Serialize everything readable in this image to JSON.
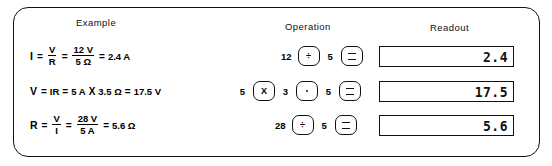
{
  "figure": {
    "headers": {
      "example": "Example",
      "operation": "Operation",
      "readout": "Readout"
    },
    "rows": [
      {
        "formula": {
          "result_symbol": "I",
          "eq1": "=",
          "frac1_num": "V",
          "frac1_den": "R",
          "eq2": "=",
          "frac2_num": "12 V",
          "frac2_den": "5 Ω",
          "eq3": "=",
          "result": "2.4 A"
        },
        "operation": {
          "operand1": "12",
          "key1": "÷",
          "operand2": "5",
          "key2": "=",
          "key1_name": "divide-key",
          "key2_name": "equals-key"
        },
        "readout": "2.4"
      },
      {
        "formula": {
          "result_symbol": "V",
          "eq1": "=",
          "expr": "IR",
          "eq2": "=",
          "operand1": "5 A",
          "times": "X",
          "operand2": "3.5 Ω",
          "eq3": "=",
          "result": "17.5 V"
        },
        "operation": {
          "operand1": "5",
          "key1": "X",
          "operand2": "3",
          "key2": ".",
          "operand3": "5",
          "key3": "=",
          "key1_name": "multiply-key",
          "key2_name": "decimal-point-key",
          "key3_name": "equals-key"
        },
        "readout": "17.5"
      },
      {
        "formula": {
          "result_symbol": "R",
          "eq1": "=",
          "frac1_num": "V",
          "frac1_den": "I",
          "eq2": "=",
          "frac2_num": "28 V",
          "frac2_den": "5 A",
          "eq3": "=",
          "result": "5.6 Ω"
        },
        "operation": {
          "operand1": "28",
          "key1": "÷",
          "operand2": "5",
          "key2": "=",
          "key1_name": "divide-key",
          "key2_name": "equals-key"
        },
        "readout": "5.6"
      }
    ]
  }
}
